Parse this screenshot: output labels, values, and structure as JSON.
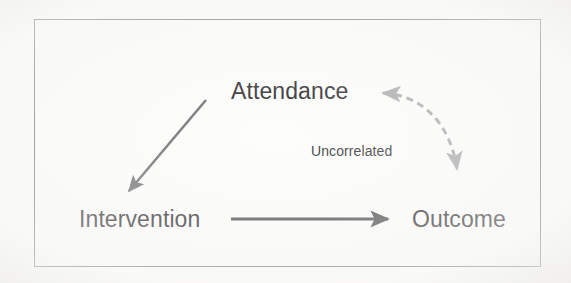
{
  "figure": {
    "type": "causal-diagram",
    "background_color": "#fdfdfc",
    "frame": {
      "border_color": "#6f6f72",
      "x": 34,
      "y": 19,
      "width": 507,
      "height": 248
    }
  },
  "nodes": [
    {
      "id": "attendance",
      "label": "Attendance",
      "x": 298,
      "y": 92,
      "font_size": 23,
      "color": "#27272a"
    },
    {
      "id": "intervention",
      "label": "Intervention",
      "x": 147,
      "y": 220,
      "font_size": 23,
      "color": "#27272a"
    },
    {
      "id": "outcome",
      "label": "Outcome",
      "x": 461,
      "y": 220,
      "font_size": 23,
      "color": "#27272a"
    }
  ],
  "edges": [
    {
      "id": "attendance-to-intervention",
      "from": "attendance",
      "to": "intervention",
      "style": "solid",
      "heads": "single",
      "direction": "down-left",
      "color": "#6e6e70",
      "label": ""
    },
    {
      "id": "intervention-to-outcome",
      "from": "intervention",
      "to": "outcome",
      "style": "solid",
      "heads": "single",
      "direction": "right",
      "color": "#4a4a4c",
      "label": ""
    },
    {
      "id": "attendance-outcome-uncorrelated",
      "from": "outcome",
      "to": "attendance",
      "style": "dashed",
      "heads": "double",
      "direction": "curved",
      "color": "#a9a9ab",
      "label": "Uncorrelated"
    }
  ],
  "annotations": [
    {
      "id": "uncorrelated-label",
      "text": "Uncorrelated",
      "x": 370,
      "y": 152,
      "font_size": 14,
      "color": "#3a3a3d"
    }
  ],
  "colors": {
    "text": "#27272a",
    "frame_border": "#6f6f72",
    "solid_arrow": "#4a4a4c",
    "diagonal_arrow": "#6e6e70",
    "dashed_arrow": "#a9a9ab",
    "background": "#fdfdfc"
  }
}
